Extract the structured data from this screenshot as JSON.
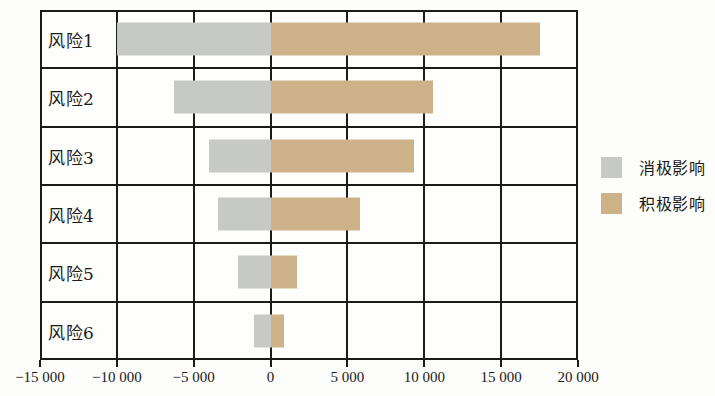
{
  "chart_data": {
    "type": "bar",
    "orientation": "horizontal",
    "stacked": "diverging",
    "title": "",
    "xlabel": "",
    "ylabel": "",
    "xlim": [
      -15000,
      20000
    ],
    "grid": true,
    "categories": [
      "风险1",
      "风险2",
      "风险3",
      "风险4",
      "风险5",
      "风险6"
    ],
    "x_ticks": [
      -15000,
      -10000,
      -5000,
      0,
      5000,
      10000,
      15000,
      20000
    ],
    "x_tick_labels": [
      "−15 000",
      "−10 000",
      "−5 000",
      "0",
      "5 000",
      "10 000",
      "15 000",
      "20 000"
    ],
    "series": [
      {
        "name": "消极影响",
        "color": "#c7c9c7",
        "values": [
          -10000,
          -6300,
          -4000,
          -3400,
          -2100,
          -1050
        ]
      },
      {
        "name": "积极影响",
        "color": "#cdb188",
        "values": [
          17500,
          10600,
          9300,
          5800,
          1700,
          900
        ]
      }
    ],
    "legend": {
      "position": "right",
      "entries": [
        {
          "label": "消极影响",
          "color": "#c7c9c7"
        },
        {
          "label": "积极影响",
          "color": "#cdb188"
        }
      ]
    }
  }
}
